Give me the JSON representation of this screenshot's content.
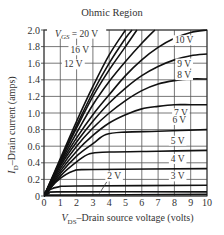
{
  "chart_data": {
    "type": "line",
    "title": "Ohmic Region",
    "xlabel_var": "V",
    "xlabel_sub": "DS",
    "xlabel_text": "–Drain source voltage (volts)",
    "ylabel_var": "I",
    "ylabel_sub": "D",
    "ylabel_text": "–Drain current (amps)",
    "xlim": [
      0,
      10
    ],
    "ylim": [
      0,
      2.0
    ],
    "x_ticks": [
      "0",
      "1",
      "2",
      "3",
      "4",
      "5",
      "6",
      "7",
      "8",
      "9",
      "10"
    ],
    "y_ticks": [
      "0",
      "0.2",
      "0.4",
      "0.6",
      "0.8",
      "1.0",
      "1.2",
      "1.4",
      "1.6",
      "1.8",
      "2.0"
    ],
    "grid": true,
    "series": [
      {
        "name": "VGS = 20 V",
        "label": "V_GS = 20 V",
        "points": [
          [
            0,
            0
          ],
          [
            1,
            0.45
          ],
          [
            2,
            0.9
          ],
          [
            3,
            1.32
          ],
          [
            4,
            1.7
          ],
          [
            5,
            2.0
          ]
        ]
      },
      {
        "name": "VGS = 16 V",
        "label": "16 V",
        "points": [
          [
            0,
            0
          ],
          [
            1,
            0.43
          ],
          [
            2,
            0.85
          ],
          [
            3,
            1.25
          ],
          [
            4,
            1.6
          ],
          [
            5,
            1.9
          ],
          [
            5.4,
            2.0
          ]
        ]
      },
      {
        "name": "VGS = 14 V",
        "label": "",
        "points": [
          [
            0,
            0
          ],
          [
            1,
            0.42
          ],
          [
            2,
            0.82
          ],
          [
            3,
            1.2
          ],
          [
            4,
            1.52
          ],
          [
            5,
            1.8
          ],
          [
            5.7,
            2.0
          ]
        ]
      },
      {
        "name": "VGS = 12 V",
        "label": "12 V",
        "points": [
          [
            0,
            0
          ],
          [
            1,
            0.4
          ],
          [
            2,
            0.76
          ],
          [
            3,
            1.1
          ],
          [
            4,
            1.38
          ],
          [
            5,
            1.62
          ],
          [
            6,
            1.84
          ],
          [
            6.8,
            2.0
          ]
        ]
      },
      {
        "name": "VGS = 10 V",
        "label": "10 V",
        "points": [
          [
            0,
            0
          ],
          [
            1,
            0.38
          ],
          [
            2,
            0.7
          ],
          [
            3,
            0.98
          ],
          [
            4,
            1.22
          ],
          [
            5,
            1.45
          ],
          [
            6,
            1.64
          ],
          [
            7,
            1.79
          ],
          [
            8,
            1.9
          ],
          [
            9,
            1.97
          ],
          [
            10,
            2.0
          ]
        ]
      },
      {
        "name": "VGS = 9 V",
        "label": "9 V",
        "points": [
          [
            0,
            0
          ],
          [
            1,
            0.36
          ],
          [
            2,
            0.65
          ],
          [
            3,
            0.9
          ],
          [
            4,
            1.12
          ],
          [
            5,
            1.3
          ],
          [
            6,
            1.45
          ],
          [
            7,
            1.56
          ],
          [
            8,
            1.64
          ],
          [
            9,
            1.69
          ],
          [
            10,
            1.71
          ]
        ]
      },
      {
        "name": "VGS = 8 V",
        "label": "8 V",
        "points": [
          [
            0,
            0
          ],
          [
            1,
            0.33
          ],
          [
            2,
            0.6
          ],
          [
            3,
            0.82
          ],
          [
            4,
            1.0
          ],
          [
            5,
            1.15
          ],
          [
            6,
            1.27
          ],
          [
            7,
            1.35
          ],
          [
            8,
            1.39
          ],
          [
            9,
            1.41
          ],
          [
            10,
            1.41
          ]
        ]
      },
      {
        "name": "VGS = 7 V",
        "label": "7 V",
        "points": [
          [
            0,
            0
          ],
          [
            1,
            0.3
          ],
          [
            2,
            0.54
          ],
          [
            3,
            0.73
          ],
          [
            4,
            0.88
          ],
          [
            5,
            0.98
          ],
          [
            6,
            1.05
          ],
          [
            7,
            1.08
          ],
          [
            8,
            1.1
          ],
          [
            9,
            1.1
          ],
          [
            10,
            1.1
          ]
        ]
      },
      {
        "name": "VGS = 6 V",
        "label": "6 V",
        "points": [
          [
            0,
            0
          ],
          [
            1,
            0.27
          ],
          [
            2,
            0.48
          ],
          [
            3,
            0.63
          ],
          [
            3.8,
            0.74
          ],
          [
            5,
            0.77
          ],
          [
            7,
            0.78
          ],
          [
            10,
            0.8
          ]
        ]
      },
      {
        "name": "VGS = 5 V",
        "label": "5 V",
        "points": [
          [
            0,
            0
          ],
          [
            1,
            0.24
          ],
          [
            2,
            0.41
          ],
          [
            2.8,
            0.51
          ],
          [
            4,
            0.53
          ],
          [
            7,
            0.54
          ],
          [
            10,
            0.55
          ]
        ]
      },
      {
        "name": "VGS = 4 V",
        "label": "4 V",
        "points": [
          [
            0,
            0
          ],
          [
            0.8,
            0.18
          ],
          [
            1.8,
            0.3
          ],
          [
            3,
            0.32
          ],
          [
            10,
            0.33
          ]
        ]
      },
      {
        "name": "VGS = 3 V",
        "label": "3 V",
        "points": [
          [
            0,
            0
          ],
          [
            0.4,
            0.08
          ],
          [
            0.9,
            0.11
          ],
          [
            2,
            0.12
          ],
          [
            10,
            0.13
          ]
        ]
      },
      {
        "name": "VGS = 2.5 V",
        "label": "",
        "points": [
          [
            0,
            0
          ],
          [
            0.3,
            0.03
          ],
          [
            0.8,
            0.05
          ],
          [
            10,
            0.05
          ]
        ]
      },
      {
        "name": "VGS = 2 V",
        "label": "2 V",
        "points": [
          [
            0,
            0
          ],
          [
            0.3,
            0.01
          ],
          [
            10,
            0.02
          ]
        ]
      }
    ],
    "annotations": [
      {
        "text": "V_GS = 20 V",
        "x": 2.0,
        "y": 1.92
      },
      {
        "text": "16 V",
        "x": 2.2,
        "y": 1.72
      },
      {
        "text": "12 V",
        "x": 1.8,
        "y": 1.55
      },
      {
        "text": "10 V",
        "x": 8.6,
        "y": 1.84
      },
      {
        "text": "9 V",
        "x": 8.6,
        "y": 1.56
      },
      {
        "text": "8 V",
        "x": 8.6,
        "y": 1.42
      },
      {
        "text": "7 V",
        "x": 8.4,
        "y": 0.96
      },
      {
        "text": "6 V",
        "x": 8.3,
        "y": 0.88
      },
      {
        "text": "5 V",
        "x": 8.2,
        "y": 0.63
      },
      {
        "text": "4 V",
        "x": 8.2,
        "y": 0.41
      },
      {
        "text": "3 V",
        "x": 8.2,
        "y": 0.2
      },
      {
        "text": "2 V",
        "x": 4.3,
        "y": 0.2
      }
    ]
  }
}
